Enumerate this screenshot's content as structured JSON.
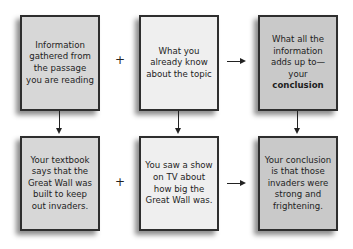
{
  "diagram": {
    "top_row": {
      "box1": {
        "text": "Information gathered from the passage you are reading"
      },
      "operator": "+",
      "box2": {
        "text": "What you already know about the topic"
      },
      "arrow": "arrow-right",
      "box3": {
        "text_prefix": "What all the information adds up to—your ",
        "text_bold": "conclusion"
      }
    },
    "bottom_row": {
      "box1": {
        "text": "Your textbook says that the Great Wall was built to keep out invaders."
      },
      "operator": "+",
      "box2": {
        "text": "You saw a show on TV about how big the Great Wall was."
      },
      "arrow": "arrow-right",
      "box3": {
        "text": "Your conclusion is that those invaders were strong and frightening."
      }
    },
    "colors": {
      "box_gathered": "#d7d7d7",
      "box_known": "#efefef",
      "box_conclusion": "#c9c9c9",
      "border": "#2e2e2e"
    }
  }
}
